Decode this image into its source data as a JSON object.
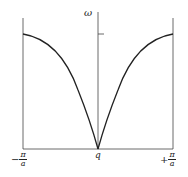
{
  "diagram": {
    "type": "dispersion-relation",
    "y_axis_label": "ω",
    "x_axis_label": "q",
    "left_label": {
      "sign": "−",
      "num": "π",
      "den": "a"
    },
    "right_label": {
      "sign": "+",
      "num": "π",
      "den": "a"
    },
    "curve_color": "#222222",
    "axis_color": "#444444"
  }
}
